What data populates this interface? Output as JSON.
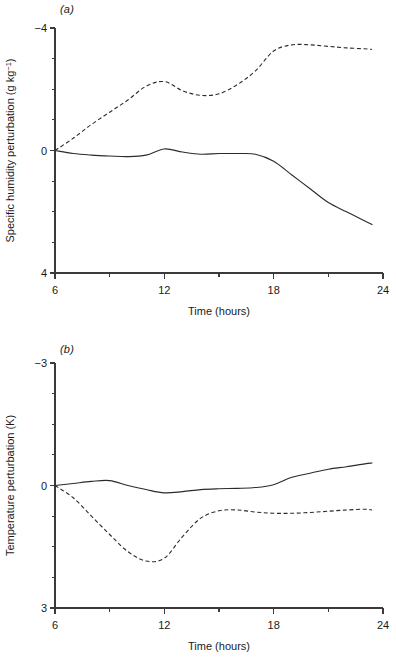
{
  "figure": {
    "panels": [
      {
        "id": "a",
        "label": "(a)",
        "ylabel_main": "Specific humidity perturbation (g kg",
        "ylabel_sup": "−1",
        "ylabel_tail": ")",
        "xlabel": "Time (hours)",
        "ytick_labels": [
          "4",
          "0",
          "−4"
        ],
        "xtick_labels": [
          "6",
          "12",
          "18",
          "24"
        ]
      },
      {
        "id": "b",
        "label": "(b)",
        "ylabel_main": "Temperature perturbation (K)",
        "ylabel_sup": "",
        "ylabel_tail": "",
        "xlabel": "Time (hours)",
        "ytick_labels": [
          "3",
          "0",
          "−3"
        ],
        "xtick_labels": [
          "6",
          "12",
          "18",
          "24"
        ]
      }
    ]
  },
  "chart_data": [
    {
      "type": "line",
      "panel": "a",
      "title": "(a)",
      "xlabel": "Time (hours)",
      "ylabel": "Specific humidity perturbation (g kg−1)",
      "xlim": [
        6,
        24
      ],
      "ylim": [
        -4,
        4
      ],
      "xticks": [
        6,
        12,
        18,
        24
      ],
      "xminor_ticks": [
        9,
        15,
        21
      ],
      "yticks": [
        -4,
        0,
        4
      ],
      "yminor_ticks": [
        -3,
        -2,
        -1,
        1,
        2,
        3
      ],
      "grid": false,
      "legend": "none",
      "x": [
        6,
        7,
        8,
        9,
        10,
        11,
        12,
        13,
        14,
        15,
        16,
        17,
        18,
        19,
        20,
        21,
        22,
        23,
        23.4
      ],
      "series": [
        {
          "name": "solid",
          "style": "solid",
          "values": [
            0.0,
            -0.1,
            -0.15,
            -0.18,
            -0.2,
            -0.15,
            0.05,
            -0.05,
            -0.12,
            -0.1,
            -0.1,
            -0.12,
            -0.35,
            -0.8,
            -1.25,
            -1.7,
            -2.0,
            -2.3,
            -2.42
          ]
        },
        {
          "name": "dashed",
          "style": "dashed",
          "values": [
            0.0,
            0.4,
            0.85,
            1.25,
            1.65,
            2.1,
            2.25,
            1.95,
            1.8,
            1.85,
            2.15,
            2.6,
            3.25,
            3.45,
            3.45,
            3.4,
            3.35,
            3.32,
            3.3
          ]
        }
      ]
    },
    {
      "type": "line",
      "panel": "b",
      "title": "(b)",
      "xlabel": "Time (hours)",
      "ylabel": "Temperature perturbation (K)",
      "xlim": [
        6,
        24
      ],
      "ylim": [
        -3,
        3
      ],
      "xticks": [
        6,
        12,
        18,
        24
      ],
      "xminor_ticks": [
        9,
        15,
        21
      ],
      "yticks": [
        -3,
        0,
        3
      ],
      "yminor_ticks": [
        -2.25,
        -1.5,
        -0.75,
        0.75,
        1.5,
        2.25
      ],
      "grid": false,
      "legend": "none",
      "x": [
        6,
        7,
        8,
        9,
        10,
        11,
        12,
        13,
        14,
        15,
        16,
        17,
        18,
        19,
        20,
        21,
        22,
        23,
        23.4
      ],
      "series": [
        {
          "name": "solid",
          "style": "solid",
          "values": [
            0.0,
            0.05,
            0.1,
            0.12,
            0.0,
            -0.1,
            -0.18,
            -0.15,
            -0.1,
            -0.08,
            -0.07,
            -0.05,
            0.02,
            0.2,
            0.3,
            0.4,
            0.46,
            0.53,
            0.55
          ]
        },
        {
          "name": "dashed",
          "style": "dashed",
          "values": [
            0.0,
            -0.3,
            -0.75,
            -1.2,
            -1.62,
            -1.85,
            -1.78,
            -1.25,
            -0.8,
            -0.62,
            -0.6,
            -0.65,
            -0.68,
            -0.68,
            -0.66,
            -0.63,
            -0.6,
            -0.58,
            -0.6
          ]
        }
      ]
    }
  ]
}
